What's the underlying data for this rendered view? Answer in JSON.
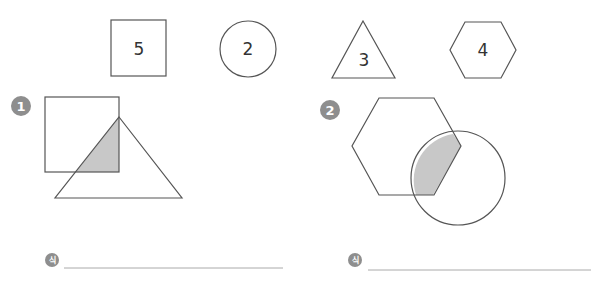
{
  "legend": {
    "square": {
      "shape": "square",
      "value": "5"
    },
    "circle": {
      "shape": "circle",
      "value": "2"
    },
    "triangle": {
      "shape": "triangle",
      "value": "3"
    },
    "hexagon": {
      "shape": "hexagon",
      "value": "4"
    }
  },
  "problems": [
    {
      "number": "1",
      "description": "square overlapping triangle, overlap shaded",
      "answer_label": "식",
      "answer_value": ""
    },
    {
      "number": "2",
      "description": "hexagon overlapping circle, overlap shaded",
      "answer_label": "식",
      "answer_value": ""
    }
  ],
  "colors": {
    "stroke": "#555555",
    "shaded": "#c8c8c8",
    "badge": "#8e8e8e"
  }
}
